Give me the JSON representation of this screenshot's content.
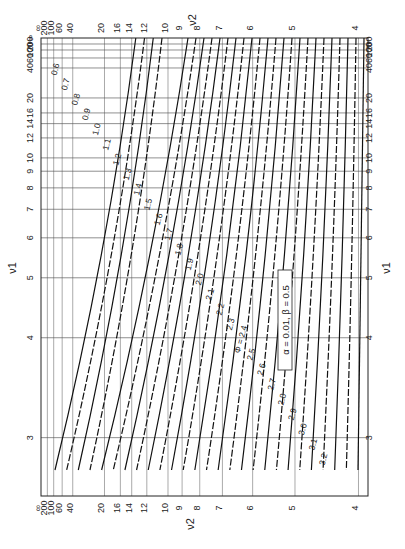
{
  "chart_data": {
    "type": "line",
    "annotation": "α = 0.01, β = 0.5",
    "xlabel": "ν2",
    "ylabel": "ν1",
    "orientation": "rotated 90° (ν1 vertical, ν2 horizontal)",
    "nu1_axis": {
      "scale": "log-like (1/ν)",
      "ticks": [
        "3",
        "4",
        "5",
        "6",
        "7",
        "8",
        "9",
        "10",
        "12",
        "14",
        "16",
        "20",
        "40",
        "60",
        "100",
        "200",
        "∞"
      ]
    },
    "nu2_axis": {
      "scale": "log-like (1/ν)",
      "ticks": [
        "∞",
        "200",
        "100",
        "60",
        "40",
        "20",
        "16",
        "14",
        "12",
        "10",
        "9",
        "8",
        "7",
        "6",
        "5",
        "4"
      ]
    },
    "grid": true,
    "series": [
      {
        "name": "φ=0.6",
        "phi": 0.6
      },
      {
        "name": "φ=0.7",
        "phi": 0.7
      },
      {
        "name": "φ=0.8",
        "phi": 0.8
      },
      {
        "name": "φ=0.9",
        "phi": 0.9
      },
      {
        "name": "φ=1.0",
        "phi": 1.0
      },
      {
        "name": "φ=1.1",
        "phi": 1.1
      },
      {
        "name": "φ=1.2",
        "phi": 1.2
      },
      {
        "name": "φ=1.3",
        "phi": 1.3
      },
      {
        "name": "φ=1.4",
        "phi": 1.4
      },
      {
        "name": "φ=1.5",
        "phi": 1.5
      },
      {
        "name": "φ=1.6",
        "phi": 1.6
      },
      {
        "name": "φ=1.7",
        "phi": 1.7
      },
      {
        "name": "φ=1.8",
        "phi": 1.8
      },
      {
        "name": "φ=1.9",
        "phi": 1.9
      },
      {
        "name": "φ=2.0",
        "phi": 2.0
      },
      {
        "name": "φ=2.1",
        "phi": 2.1
      },
      {
        "name": "φ=2.2",
        "phi": 2.2
      },
      {
        "name": "φ=2.3",
        "phi": 2.3
      },
      {
        "name": "φ=2.4",
        "phi": 2.4
      },
      {
        "name": "φ=2.5",
        "phi": 2.5
      },
      {
        "name": "φ=2.6",
        "phi": 2.6
      },
      {
        "name": "φ=2.7",
        "phi": 2.7
      },
      {
        "name": "φ=2.8",
        "phi": 2.8
      },
      {
        "name": "φ=2.9",
        "phi": 2.9
      },
      {
        "name": "φ=3.0",
        "phi": 3.0
      },
      {
        "name": "φ=3.1",
        "phi": 3.1
      },
      {
        "name": "φ=3.2",
        "phi": 3.2
      }
    ],
    "curve_labels": [
      "0.6",
      "0.7",
      "0.8",
      "0.9",
      "1.0",
      "1.1",
      "1.2",
      "1.3",
      "1.4",
      "1.5",
      "1.6",
      "1.7",
      "1.8",
      "1.9",
      "2.0",
      "2.1",
      "2.2",
      "2.3",
      "Φ = 2.4",
      "2.5",
      "2.6",
      "2.7",
      "2.8",
      "2.9",
      "3.0",
      "3.1",
      "3.2"
    ]
  },
  "labels": {
    "nu1": "ν1",
    "nu2": "ν2",
    "annotation": "α = 0.01, β = 0.5"
  }
}
